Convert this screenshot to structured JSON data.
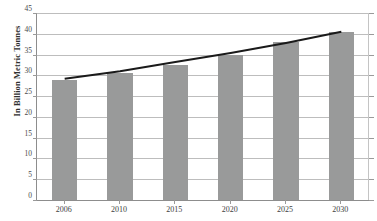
{
  "chart_data": {
    "type": "bar",
    "title": "",
    "xlabel": "",
    "ylabel": "In Billion Metric Tonnes",
    "categories": [
      "2006",
      "2010",
      "2015",
      "2020",
      "2025",
      "2030"
    ],
    "values": [
      29,
      30.5,
      32.5,
      35,
      38,
      40.5
    ],
    "series": [
      {
        "name": "Emissions",
        "type": "bar",
        "values": [
          29,
          30.5,
          32.5,
          35,
          38,
          40.5
        ]
      },
      {
        "name": "Trendline",
        "type": "line",
        "values": [
          29.2,
          31.0,
          33.2,
          35.4,
          37.8,
          40.5
        ]
      }
    ],
    "ylim": [
      0,
      45
    ],
    "yticks": [
      0,
      5,
      10,
      15,
      20,
      25,
      30,
      35,
      40,
      45
    ],
    "ytick_labels": [
      "0",
      "5",
      "10",
      "15",
      "20",
      "25",
      "30",
      "35",
      "40",
      "45"
    ],
    "grid": true,
    "grid_axis": "y",
    "legend": false,
    "legend_position": "none",
    "bar_color": "#999a9a",
    "trendline_color": "#1a1a1a",
    "gridline_color": "#bdbdbd",
    "axis_color": "#8d8d8d",
    "background_color": "#ffffff",
    "annotations": []
  }
}
